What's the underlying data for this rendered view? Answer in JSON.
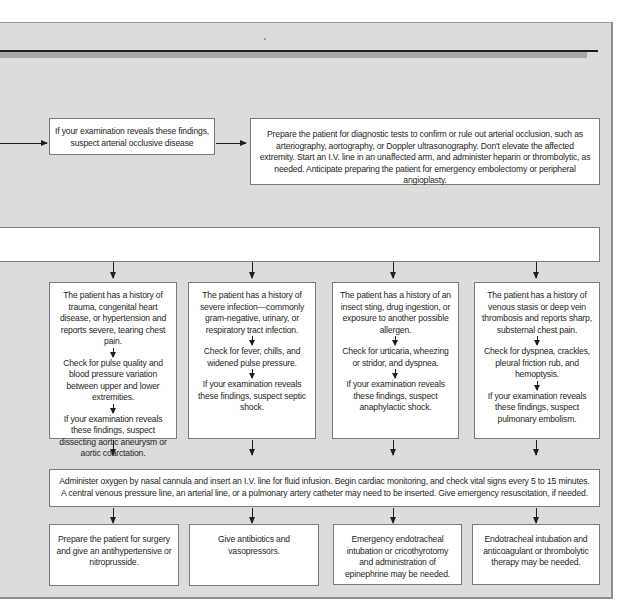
{
  "flowchart": {
    "top_path": {
      "finding": "If your examination reveals these findings, suspect arterial occlusive disease",
      "action": "Prepare the patient for diagnostic tests to confirm or rule out arterial occlusion, such as arteriography, aortography, or Doppler ultrasonography. Don't elevate the affected extremity. Start an I.V. line in an unaffected arm, and administer heparin or thrombolytic, as needed. Anticipate preparing the patient for emergency embolectomy or peripheral angioplasty."
    },
    "branches": [
      {
        "history": "The patient has a history of trauma, congenital heart disease, or hypertension and reports severe, tearing chest pain.",
        "check": "Check for pulse quality and blood pressure variation between upper and lower extremities.",
        "finding": "If your examination reveals these findings, suspect dissecting aortic aneurysm or aortic coarctation.",
        "treatment": "Prepare the patient for surgery and give an antihypertensive or nitroprusside."
      },
      {
        "history": "The patient has a history of severe infection—commonly gram-negative, urinary, or respiratory tract infection.",
        "check": "Check for fever, chills, and widened pulse pressure.",
        "finding": "If your examination reveals these findings, suspect septic shock.",
        "treatment": "Give antibiotics and vasopressors."
      },
      {
        "history": "The patient has a history of an insect sting, drug ingestion, or exposure to another possible allergen.",
        "check": "Check for urticaria, wheezing or stridor, and dyspnea.",
        "finding": "If your examination reveals these findings, suspect anaphylactic shock.",
        "treatment": "Emergency endotracheal intubation or cricothyrotomy and administration of epinephrine may be needed."
      },
      {
        "history": "The patient has a history of venous stasis or deep vein thrombosis and reports sharp, substernal chest pain.",
        "check": "Check for dyspnea, crackles, pleural friction rub, and hemoptysis.",
        "finding": "If your examination reveals these findings, suspect pulmonary embolism.",
        "treatment": "Endotracheal intubation and anticoagulant or thrombolytic therapy may be needed."
      }
    ],
    "common_intervention": "Administer oxygen by nasal cannula and insert an I.V. line for fluid infusion. Begin cardiac monitoring, and check vital signs every 5 to 15 minutes. A central venous pressure line, an arterial line, or a pulmonary artery catheter may need to be inserted. Give emergency resuscitation, if needed.",
    "colors": {
      "background_panel": "#dcdcdc",
      "box_fill": "#ffffff",
      "box_border": "#7b7b7b",
      "arrow": "#1e1e1e"
    }
  }
}
